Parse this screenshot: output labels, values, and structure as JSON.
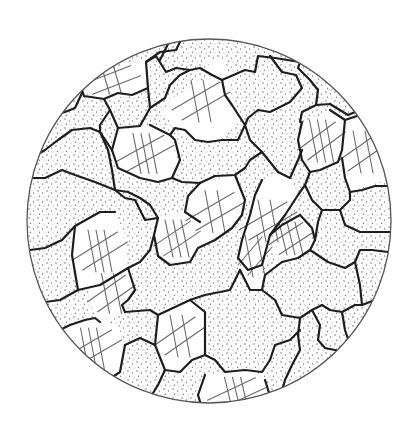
{
  "figure": {
    "kind": "micrograph-sketch",
    "background_color": "#ffffff",
    "line_color": "#1e1e1e",
    "field_edge_color": "#555555"
  },
  "phases": [
    {
      "id": "stippled",
      "label": "stippled grain phase",
      "pattern": "dots",
      "color": "#7a7a7a"
    },
    {
      "id": "hatched",
      "label": "hatched grain phase (crossed lines)",
      "pattern": "cross-hatch",
      "color": "#6a6a6a"
    }
  ],
  "grains": [
    {
      "phase": "hatched"
    },
    {
      "phase": "stippled"
    },
    {
      "phase": "stippled"
    },
    {
      "phase": "stippled"
    },
    {
      "phase": "stippled"
    },
    {
      "phase": "hatched"
    },
    {
      "phase": "stippled"
    },
    {
      "phase": "stippled"
    },
    {
      "phase": "hatched"
    },
    {
      "phase": "stippled"
    },
    {
      "phase": "hatched"
    },
    {
      "phase": "hatched"
    },
    {
      "phase": "stippled"
    },
    {
      "phase": "stippled"
    },
    {
      "phase": "hatched"
    },
    {
      "phase": "hatched"
    },
    {
      "phase": "hatched"
    },
    {
      "phase": "stippled"
    },
    {
      "phase": "stippled"
    },
    {
      "phase": "hatched"
    },
    {
      "phase": "stippled"
    },
    {
      "phase": "hatched"
    },
    {
      "phase": "stippled"
    },
    {
      "phase": "stippled"
    },
    {
      "phase": "stippled"
    },
    {
      "phase": "stippled"
    },
    {
      "phase": "stippled"
    },
    {
      "phase": "stippled"
    },
    {
      "phase": "stippled"
    },
    {
      "phase": "hatched"
    },
    {
      "phase": "stippled"
    },
    {
      "phase": "stippled"
    },
    {
      "phase": "hatched"
    },
    {
      "phase": "stippled"
    },
    {
      "phase": "stippled"
    },
    {
      "phase": "hatched"
    }
  ]
}
